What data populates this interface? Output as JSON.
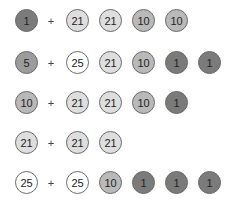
{
  "coin_colors": {
    "1": "#7b7b7b",
    "5": "#9c9c9c",
    "10": "#b9b9b9",
    "21": "#dedede",
    "25": "#ffffff"
  },
  "plus_symbol": "+",
  "rows": [
    {
      "left": "1",
      "right": [
        "21",
        "21",
        "10",
        "10"
      ],
      "y": 9
    },
    {
      "left": "5",
      "right": [
        "25",
        "21",
        "10",
        "1",
        "1"
      ],
      "y": 51
    },
    {
      "left": "10",
      "right": [
        "21",
        "21",
        "10",
        "1"
      ],
      "y": 91
    },
    {
      "left": "21",
      "right": [
        "21",
        "21"
      ],
      "y": 131
    },
    {
      "left": "25",
      "right": [
        "25",
        "10",
        "1",
        "1",
        "1"
      ],
      "y": 171
    }
  ],
  "layout": {
    "left_coin_x": 15,
    "plus_x": 46,
    "right_coin_x": [
      66,
      99,
      132,
      165,
      198
    ]
  }
}
